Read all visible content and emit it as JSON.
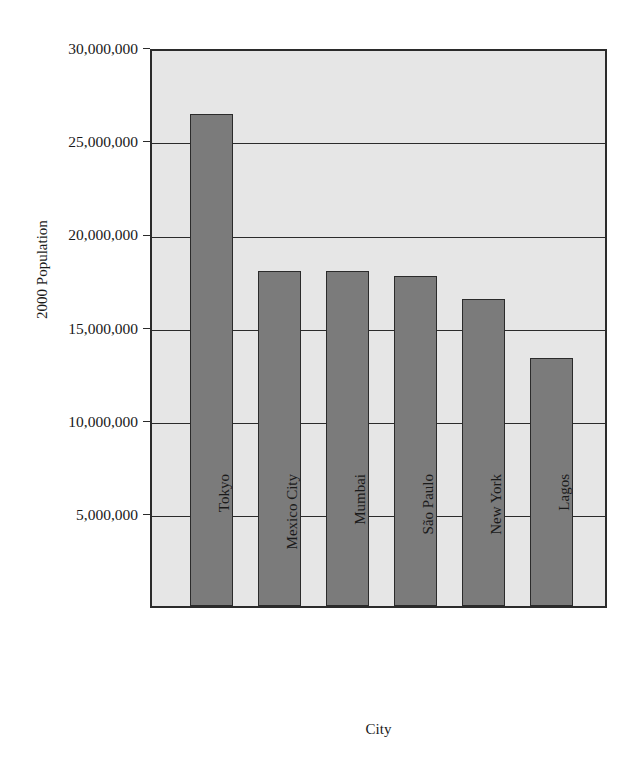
{
  "chart_data": {
    "type": "bar",
    "title": "",
    "xlabel": "City",
    "ylabel": "2000 Population",
    "categories": [
      "Tokyo",
      "Mexico City",
      "Mumbai",
      "São Paulo",
      "New York",
      "Lagos"
    ],
    "values": [
      26400000,
      18000000,
      18000000,
      17700000,
      16500000,
      13300000
    ],
    "ylim": [
      0,
      30000000
    ],
    "ytick_values": [
      5000000,
      10000000,
      15000000,
      20000000,
      25000000,
      30000000
    ],
    "ytick_labels": [
      "5,000,000",
      "10,000,000",
      "15,000,000",
      "20,000,000",
      "25,000,000",
      "30,000,000"
    ],
    "grid": true,
    "legend": false,
    "legend_position": "none",
    "bar_color": "#7b7b7b",
    "plot_background_color": "#e6e6e6",
    "axis_color": "#2b2b2b",
    "page_background_color": "#ffffff"
  }
}
